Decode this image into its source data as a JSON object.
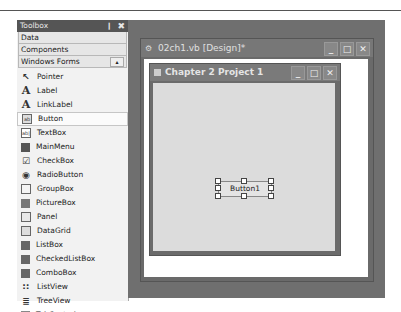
{
  "toolbox": {
    "title": "Toolbox",
    "pin_glyph": "❙",
    "close_glyph": "✖",
    "tabs": [
      {
        "label": "Data"
      },
      {
        "label": "Components"
      },
      {
        "label": "Windows Forms",
        "scroll_glyph": "▴"
      }
    ],
    "items": [
      {
        "label": "Pointer",
        "icon": "pointer-icon",
        "glyph": "↖"
      },
      {
        "label": "Label",
        "icon": "label-icon",
        "glyph": "A"
      },
      {
        "label": "LinkLabel",
        "icon": "linklabel-icon",
        "glyph": "A"
      },
      {
        "label": "Button",
        "icon": "button-icon",
        "glyph": "ab",
        "selected": true
      },
      {
        "label": "TextBox",
        "icon": "textbox-icon",
        "glyph": "ab|"
      },
      {
        "label": "MainMenu",
        "icon": "mainmenu-icon",
        "glyph": ""
      },
      {
        "label": "CheckBox",
        "icon": "checkbox-icon",
        "glyph": "☑"
      },
      {
        "label": "RadioButton",
        "icon": "radiobutton-icon",
        "glyph": "◉"
      },
      {
        "label": "GroupBox",
        "icon": "groupbox-icon",
        "glyph": "⬚"
      },
      {
        "label": "PictureBox",
        "icon": "picturebox-icon",
        "glyph": ""
      },
      {
        "label": "Panel",
        "icon": "panel-icon",
        "glyph": "⬚"
      },
      {
        "label": "DataGrid",
        "icon": "datagrid-icon",
        "glyph": "▦"
      },
      {
        "label": "ListBox",
        "icon": "listbox-icon",
        "glyph": "≡"
      },
      {
        "label": "CheckedListBox",
        "icon": "checkedlistbox-icon",
        "glyph": "☑"
      },
      {
        "label": "ComboBox",
        "icon": "combobox-icon",
        "glyph": "▾"
      },
      {
        "label": "ListView",
        "icon": "listview-icon",
        "glyph": "∷"
      },
      {
        "label": "TreeView",
        "icon": "treeview-icon",
        "glyph": "≣"
      },
      {
        "label": "TabControl",
        "icon": "tabcontrol-icon",
        "glyph": "⬚"
      }
    ]
  },
  "document": {
    "title": "02ch1.vb [Design]*",
    "icon_glyph": "⚙",
    "buttons": {
      "minimize": "_",
      "maximize": "□",
      "close": "✕"
    }
  },
  "form": {
    "title": "Chapter 2 Project 1",
    "buttons": {
      "minimize": "_",
      "maximize": "□",
      "close": "✕"
    },
    "button1_label": "Button1"
  }
}
